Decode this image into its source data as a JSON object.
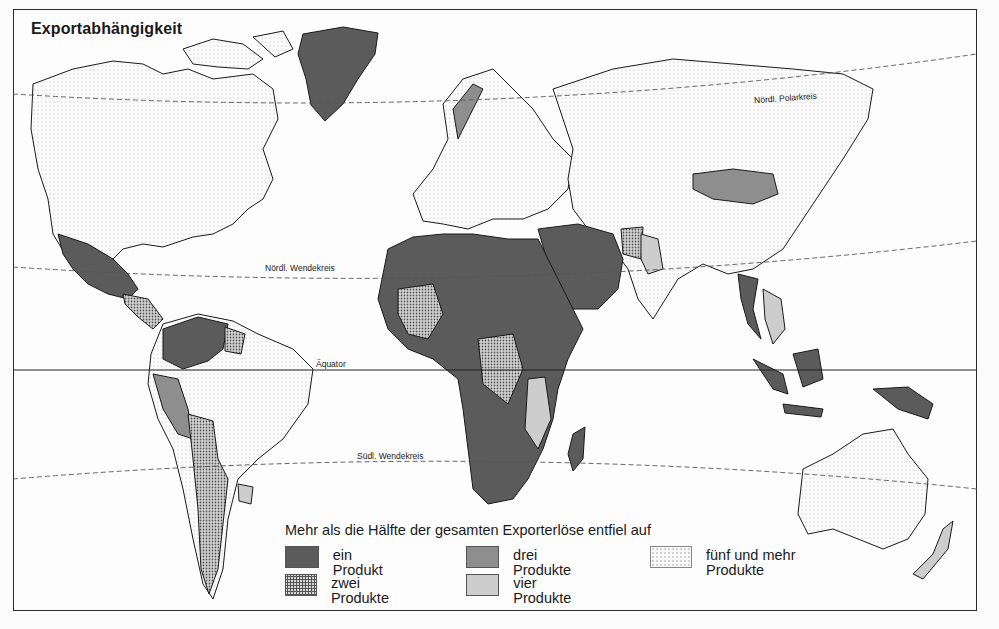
{
  "title": "Exportabhängigkeit",
  "lines": {
    "arctic_circle": "Nördl. Polarkreis",
    "tropic_cancer": "Nördl. Wendekreis",
    "equator": "Äquator",
    "tropic_capricorn": "Südl. Wendekreis"
  },
  "legend": {
    "heading": "Mehr als die Hälfte der gesamten Exporterlöse entfiel auf",
    "items": [
      {
        "label": "ein Produkt",
        "color": "#5b5b5b"
      },
      {
        "label": "zwei Produkte",
        "pattern": "dotted-dark"
      },
      {
        "label": "drei Produkte",
        "color": "#8e8e8e"
      },
      {
        "label": "vier Produkte",
        "color": "#cdcdcd"
      },
      {
        "label": "fünf und mehr Produkte",
        "pattern": "dotted-light"
      }
    ]
  },
  "colors": {
    "ein": "#5b5b5b",
    "drei": "#8e8e8e",
    "vier": "#cdcdcd",
    "outline": "#1a1a1a",
    "background": "#fdfdfd"
  }
}
